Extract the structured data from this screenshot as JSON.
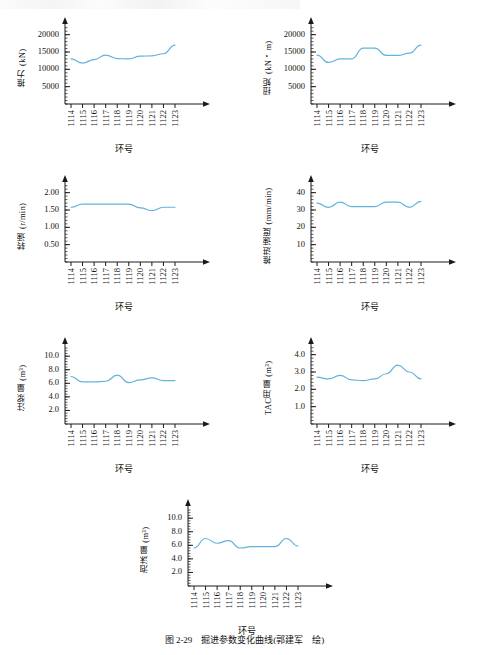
{
  "page": {
    "caption": "图 2-29　掘进参数变化曲线(郭建军　绘)",
    "line_color": "#63b2dd",
    "axis_color": "#1a1a1a",
    "background": "#ffffff"
  },
  "chart_data": [
    {
      "id": "thrust",
      "type": "line",
      "title": "",
      "ylabel": "推力 (kN)",
      "xlabel": "环号",
      "categories": [
        "1114",
        "1115",
        "1116",
        "1117",
        "1118",
        "1119",
        "1120",
        "1121",
        "1122",
        "1123"
      ],
      "yticks": [
        "5000",
        "10000",
        "15000",
        "20000"
      ],
      "ytick_values": [
        5000,
        10000,
        15000,
        20000
      ],
      "ylim": [
        0,
        22500
      ],
      "values": [
        13000,
        11800,
        12800,
        14100,
        13100,
        13000,
        13800,
        13900,
        14500,
        17000
      ],
      "grid": false,
      "legend": "none"
    },
    {
      "id": "torque",
      "type": "line",
      "title": "",
      "ylabel": "扭矩 (kN・m)",
      "xlabel": "环号",
      "categories": [
        "1114",
        "1115",
        "1116",
        "1117",
        "1118",
        "1119",
        "1120",
        "1121",
        "1122",
        "1123"
      ],
      "yticks": [
        "5000",
        "10000",
        "15000",
        "20000"
      ],
      "ytick_values": [
        5000,
        10000,
        15000,
        20000
      ],
      "ylim": [
        0,
        22500
      ],
      "values": [
        14100,
        12000,
        13000,
        13000,
        16100,
        16100,
        14000,
        14000,
        14700,
        17000
      ],
      "grid": false,
      "legend": "none"
    },
    {
      "id": "rotation-speed",
      "type": "line",
      "title": "",
      "ylabel": "转速 (r/min)",
      "xlabel": "环号",
      "categories": [
        "1114",
        "1115",
        "1116",
        "1117",
        "1118",
        "1119",
        "1120",
        "1121",
        "1122",
        "1123"
      ],
      "yticks": [
        "0.50",
        "1.00",
        "1.50",
        "2.00"
      ],
      "ytick_values": [
        0.5,
        1.0,
        1.5,
        2.0
      ],
      "ylim": [
        0,
        2.25
      ],
      "values": [
        1.58,
        1.67,
        1.67,
        1.67,
        1.67,
        1.67,
        1.56,
        1.48,
        1.58,
        1.58
      ],
      "grid": false,
      "legend": "none"
    },
    {
      "id": "advance-speed",
      "type": "line",
      "title": "",
      "ylabel": "推进速度 (mm/min)",
      "xlabel": "环号",
      "categories": [
        "1114",
        "1115",
        "1116",
        "1117",
        "1118",
        "1119",
        "1120",
        "1121",
        "1122",
        "1123"
      ],
      "yticks": [
        "10",
        "20",
        "30",
        "40"
      ],
      "ytick_values": [
        10,
        20,
        30,
        40
      ],
      "ylim": [
        0,
        45
      ],
      "values": [
        34,
        31.5,
        34.5,
        32,
        32,
        32,
        34.5,
        34.5,
        31.5,
        35
      ],
      "grid": false,
      "legend": "none"
    },
    {
      "id": "grout-volume",
      "type": "line",
      "title": "",
      "ylabel": "注浆量 (m³)",
      "xlabel": "环号",
      "categories": [
        "1114",
        "1115",
        "1116",
        "1117",
        "1118",
        "1119",
        "1120",
        "1121",
        "1122",
        "1123"
      ],
      "yticks": [
        "2.0",
        "4.0",
        "6.0",
        "8.0",
        "10.0"
      ],
      "ytick_values": [
        2,
        4,
        6,
        8,
        10
      ],
      "ylim": [
        0,
        11.5
      ],
      "values": [
        7.0,
        6.2,
        6.2,
        6.3,
        7.2,
        6.1,
        6.5,
        6.8,
        6.4,
        6.4
      ],
      "grid": false,
      "legend": "none"
    },
    {
      "id": "tac-consumption",
      "type": "line",
      "title": "",
      "ylabel": "TAC用量 (m³)",
      "xlabel": "环号",
      "categories": [
        "1114",
        "1115",
        "1116",
        "1117",
        "1118",
        "1119",
        "1120",
        "1121",
        "1122",
        "1123"
      ],
      "yticks": [
        "1.0",
        "2.0",
        "3.0",
        "4.0"
      ],
      "ytick_values": [
        1,
        2,
        3,
        4
      ],
      "ylim": [
        0,
        4.5
      ],
      "values": [
        2.7,
        2.6,
        2.8,
        2.55,
        2.5,
        2.6,
        2.9,
        3.4,
        3.0,
        2.6
      ],
      "grid": false,
      "legend": "none"
    },
    {
      "id": "foam-volume",
      "type": "line",
      "title": "",
      "ylabel": "泡沫量 (m³)",
      "xlabel": "环号",
      "categories": [
        "1114",
        "1115",
        "1116",
        "1117",
        "1118",
        "1119",
        "1120",
        "1121",
        "1122",
        "1123"
      ],
      "yticks": [
        "2.0",
        "4.0",
        "6.0",
        "8.0",
        "10.0"
      ],
      "ytick_values": [
        2,
        4,
        6,
        8,
        10
      ],
      "ylim": [
        0,
        11.5
      ],
      "values": [
        5.6,
        7.0,
        6.3,
        6.7,
        5.6,
        5.8,
        5.8,
        5.8,
        7.0,
        5.9
      ],
      "grid": false,
      "legend": "none"
    }
  ]
}
